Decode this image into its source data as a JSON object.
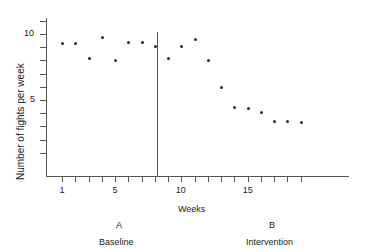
{
  "chart_data": {
    "type": "scatter",
    "title": "",
    "xlabel": "Weeks",
    "ylabel": "Number of fights per week",
    "xlim": [
      0,
      20
    ],
    "ylim": [
      0,
      12
    ],
    "grid": false,
    "legend": "none",
    "x_ticklabels": [
      "1",
      "5",
      "10",
      "15"
    ],
    "x_ticklabel_values": [
      1,
      5,
      10,
      15
    ],
    "x_minor_ticks": [
      1,
      2,
      3,
      4,
      5,
      6,
      7,
      8,
      9,
      10,
      11,
      12,
      13,
      14,
      15,
      16,
      17,
      18,
      19
    ],
    "y_ticklabels": [
      "10",
      "5"
    ],
    "y_ticklabel_values": [
      10,
      5
    ],
    "y_minor_ticks": [
      1,
      2,
      3,
      4,
      5,
      6,
      7,
      8,
      9,
      10,
      11
    ],
    "x": [
      1,
      2,
      3,
      4,
      5,
      6,
      7,
      8,
      9,
      10,
      11,
      12,
      13,
      14,
      15,
      16,
      17,
      18,
      19
    ],
    "values": [
      9.3,
      9.3,
      8.2,
      9.8,
      8.0,
      9.4,
      9.4,
      9.1,
      8.2,
      9.1,
      9.6,
      8.0,
      6.0,
      4.5,
      4.4,
      4.1,
      3.4,
      3.4,
      3.3
    ],
    "phase_divider_x": 7.5,
    "annotations": [
      {
        "letter": "A",
        "name": "Baseline"
      },
      {
        "letter": "B",
        "name": "Intervention"
      }
    ]
  },
  "axes": {
    "y_title": "Number of fights per week",
    "x_title": "Weeks"
  },
  "phases": {
    "a_letter": "A",
    "a_name": "Baseline",
    "b_letter": "B",
    "b_name": "Intervention"
  },
  "colors": {
    "point": "#2b2b2b",
    "axis": "#555555",
    "text": "#1a1a1a",
    "background": "#ffffff"
  }
}
